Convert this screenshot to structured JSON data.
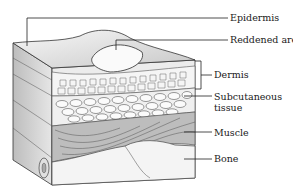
{
  "diagram": {
    "labels": [
      {
        "id": "epidermis",
        "text": "Epidermis"
      },
      {
        "id": "reddened-area",
        "text": "Reddened area"
      },
      {
        "id": "dermis",
        "text": "Dermis"
      },
      {
        "id": "subcutaneous",
        "text": "Subcutaneous"
      },
      {
        "id": "subcutaneous-2",
        "text": "tissue"
      },
      {
        "id": "muscle",
        "text": "Muscle"
      },
      {
        "id": "bone",
        "text": "Bone"
      }
    ],
    "colors": {
      "line": "#333333",
      "fill_light": "#f2f2f2",
      "fill_mid": "#cfcfcf",
      "fill_dark": "#8a8a8a"
    }
  }
}
